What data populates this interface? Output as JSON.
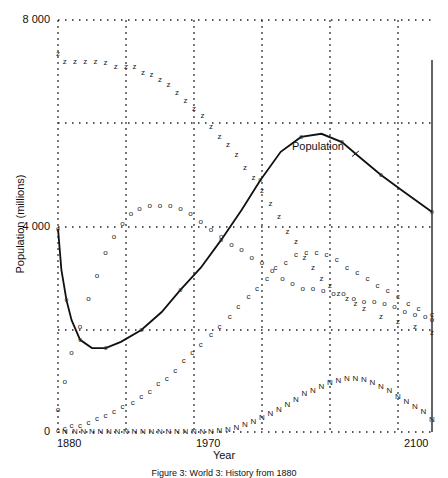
{
  "chart_data": {
    "type": "line",
    "title": "",
    "caption": "Figure 3: World 3: History from 1880",
    "xlabel": "Year",
    "ylabel": "Population (millions)",
    "xlim": [
      1880,
      2100
    ],
    "ylim": [
      0,
      8000
    ],
    "grid": true,
    "grid_style": "dotted",
    "x_tick_labels": [
      "1880",
      "1970",
      "2100"
    ],
    "y_tick_labels": [
      "0",
      "4 000",
      "8 000"
    ],
    "annotations": [
      {
        "text": "Population",
        "x": 2057,
        "y": 5650,
        "arrow_to": [
          2053,
          5350
        ]
      }
    ],
    "legend": [],
    "series": [
      {
        "name": "Population",
        "style": "solid-line",
        "points": [
          [
            1880,
            3950
          ],
          [
            1882,
            3150
          ],
          [
            1885,
            2560
          ],
          [
            1888,
            2170
          ],
          [
            1893,
            1790
          ],
          [
            1900,
            1630
          ],
          [
            1908,
            1630
          ],
          [
            1917,
            1750
          ],
          [
            1929,
            1980
          ],
          [
            1941,
            2330
          ],
          [
            1952,
            2760
          ],
          [
            1964,
            3190
          ],
          [
            1976,
            3730
          ],
          [
            1988,
            4310
          ],
          [
            1999,
            4890
          ],
          [
            1911,
            0
          ],
          [
            2011,
            5440
          ],
          [
            2023,
            5730
          ],
          [
            2035,
            5790
          ],
          [
            2047,
            5630
          ],
          [
            2058,
            5320
          ],
          [
            2070,
            4990
          ],
          [
            2082,
            4700
          ],
          [
            2100,
            4270
          ]
        ]
      },
      {
        "name": "z-series",
        "style": "marker-z",
        "points": [
          [
            1880,
            7350
          ],
          [
            1884,
            7200
          ],
          [
            1890,
            7200
          ],
          [
            1896,
            7200
          ],
          [
            1902,
            7200
          ],
          [
            1908,
            7180
          ],
          [
            1914,
            7100
          ],
          [
            1920,
            7100
          ],
          [
            1925,
            7100
          ],
          [
            1930,
            7000
          ],
          [
            1935,
            6950
          ],
          [
            1940,
            6850
          ],
          [
            1945,
            6750
          ],
          [
            1950,
            6600
          ],
          [
            1955,
            6450
          ],
          [
            1960,
            6300
          ],
          [
            1965,
            6150
          ],
          [
            1970,
            5950
          ],
          [
            1975,
            5750
          ],
          [
            1980,
            5600
          ],
          [
            1985,
            5400
          ],
          [
            1990,
            5150
          ],
          [
            1995,
            4950
          ],
          [
            2000,
            4700
          ],
          [
            2005,
            4450
          ],
          [
            2010,
            4200
          ],
          [
            2015,
            3900
          ],
          [
            2020,
            3700
          ],
          [
            2025,
            3400
          ],
          [
            2030,
            3200
          ],
          [
            2035,
            3000
          ],
          [
            2040,
            2850
          ],
          [
            2045,
            2700
          ],
          [
            2050,
            2600
          ],
          [
            2055,
            2500
          ],
          [
            2060,
            2400
          ],
          [
            2070,
            2250
          ],
          [
            2080,
            2150
          ],
          [
            2090,
            2050
          ],
          [
            2100,
            1950
          ]
        ]
      },
      {
        "name": "o-series",
        "style": "marker-o",
        "points": [
          [
            1880,
            450
          ],
          [
            1884,
            1000
          ],
          [
            1888,
            1550
          ],
          [
            1893,
            2050
          ],
          [
            1898,
            2600
          ],
          [
            1903,
            3050
          ],
          [
            1908,
            3500
          ],
          [
            1913,
            3800
          ],
          [
            1918,
            4050
          ],
          [
            1923,
            4250
          ],
          [
            1928,
            4350
          ],
          [
            1934,
            4400
          ],
          [
            1940,
            4400
          ],
          [
            1946,
            4400
          ],
          [
            1952,
            4350
          ],
          [
            1958,
            4250
          ],
          [
            1964,
            4100
          ],
          [
            1970,
            3950
          ],
          [
            1976,
            3800
          ],
          [
            1982,
            3650
          ],
          [
            1988,
            3550
          ],
          [
            1994,
            3400
          ],
          [
            2000,
            3300
          ],
          [
            2006,
            3150
          ],
          [
            2012,
            3000
          ],
          [
            2018,
            2900
          ],
          [
            2024,
            2800
          ],
          [
            2030,
            2800
          ],
          [
            2036,
            2750
          ],
          [
            2042,
            2700
          ],
          [
            2048,
            2700
          ],
          [
            2054,
            2600
          ],
          [
            2060,
            2550
          ],
          [
            2066,
            2550
          ],
          [
            2072,
            2500
          ],
          [
            2078,
            2450
          ],
          [
            2084,
            2350
          ],
          [
            2090,
            2300
          ],
          [
            2096,
            2250
          ],
          [
            2100,
            2200
          ]
        ]
      },
      {
        "name": "c-series",
        "style": "marker-c",
        "points": [
          [
            1880,
            30
          ],
          [
            1884,
            80
          ],
          [
            1888,
            130
          ],
          [
            1893,
            130
          ],
          [
            1898,
            200
          ],
          [
            1903,
            280
          ],
          [
            1908,
            330
          ],
          [
            1913,
            400
          ],
          [
            1918,
            500
          ],
          [
            1924,
            580
          ],
          [
            1929,
            700
          ],
          [
            1934,
            800
          ],
          [
            1939,
            950
          ],
          [
            1944,
            1050
          ],
          [
            1949,
            1200
          ],
          [
            1954,
            1400
          ],
          [
            1959,
            1550
          ],
          [
            1964,
            1700
          ],
          [
            1970,
            1900
          ],
          [
            1975,
            2050
          ],
          [
            1981,
            2250
          ],
          [
            1986,
            2450
          ],
          [
            1992,
            2650
          ],
          [
            1997,
            2800
          ],
          [
            2003,
            3000
          ],
          [
            2008,
            3200
          ],
          [
            2014,
            3300
          ],
          [
            2020,
            3450
          ],
          [
            2026,
            3500
          ],
          [
            2032,
            3500
          ],
          [
            2038,
            3450
          ],
          [
            2044,
            3350
          ],
          [
            2050,
            3200
          ],
          [
            2056,
            3100
          ],
          [
            2062,
            3000
          ],
          [
            2068,
            2850
          ],
          [
            2074,
            2750
          ],
          [
            2080,
            2650
          ],
          [
            2086,
            2500
          ],
          [
            2092,
            2400
          ],
          [
            2100,
            2300
          ]
        ]
      },
      {
        "name": "N-series",
        "style": "marker-N",
        "points": [
          [
            1884,
            20
          ],
          [
            1890,
            20
          ],
          [
            1895,
            20
          ],
          [
            1900,
            20
          ],
          [
            1905,
            20
          ],
          [
            1910,
            20
          ],
          [
            1915,
            20
          ],
          [
            1920,
            20
          ],
          [
            1925,
            20
          ],
          [
            1930,
            20
          ],
          [
            1935,
            20
          ],
          [
            1940,
            20
          ],
          [
            1945,
            20
          ],
          [
            1950,
            20
          ],
          [
            1955,
            20
          ],
          [
            1960,
            20
          ],
          [
            1965,
            20
          ],
          [
            1970,
            20
          ],
          [
            1975,
            30
          ],
          [
            1980,
            60
          ],
          [
            1985,
            100
          ],
          [
            1990,
            150
          ],
          [
            1995,
            220
          ],
          [
            2000,
            290
          ],
          [
            2005,
            370
          ],
          [
            2010,
            450
          ],
          [
            2015,
            550
          ],
          [
            2020,
            650
          ],
          [
            2025,
            750
          ],
          [
            2030,
            820
          ],
          [
            2035,
            900
          ],
          [
            2040,
            970
          ],
          [
            2045,
            1010
          ],
          [
            2050,
            1040
          ],
          [
            2055,
            1050
          ],
          [
            2060,
            1020
          ],
          [
            2065,
            970
          ],
          [
            2070,
            900
          ],
          [
            2075,
            820
          ],
          [
            2080,
            700
          ],
          [
            2085,
            600
          ],
          [
            2090,
            500
          ],
          [
            2095,
            400
          ],
          [
            2100,
            250
          ]
        ]
      }
    ]
  }
}
